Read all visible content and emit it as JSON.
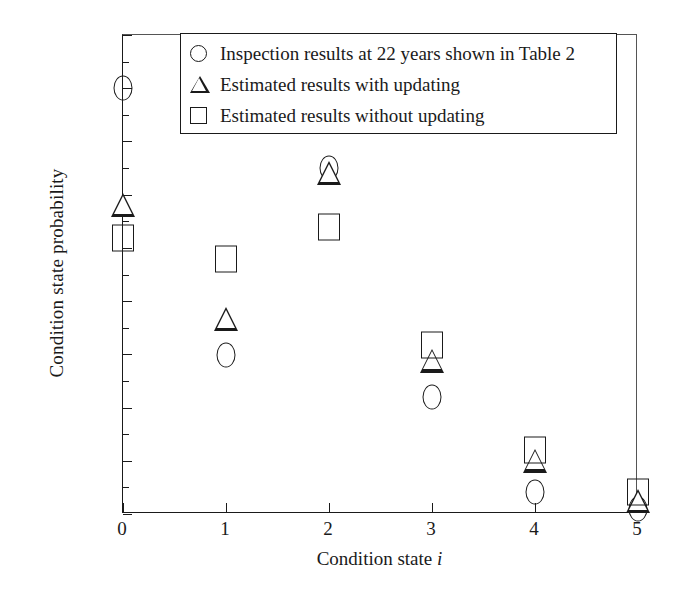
{
  "chart_data": {
    "type": "scatter",
    "title": "",
    "xlabel": "Condition state i",
    "ylabel": "Condition state probability",
    "categories": [
      "0",
      "1",
      "2",
      "3",
      "4",
      "5"
    ],
    "x": [
      0,
      1,
      2,
      3,
      4,
      5
    ],
    "xlim": [
      0,
      5
    ],
    "ylim": [
      0.0,
      0.45
    ],
    "ytick_labels": [
      "0.00",
      "0.05",
      "0.10",
      "0.15",
      "0.20",
      "0.25",
      "0.30",
      "0.35",
      "0.40",
      "0.45"
    ],
    "ytick_values": [
      0.0,
      0.05,
      0.1,
      0.15,
      0.2,
      0.25,
      0.3,
      0.35,
      0.4,
      0.45
    ],
    "xtick_labels": [
      "0",
      "1",
      "2",
      "3",
      "4",
      "5"
    ],
    "grid": false,
    "legend_position": "top-center",
    "series": [
      {
        "name": "Inspection results at 22 years shown in Table 2",
        "marker": "circle",
        "values": [
          0.4,
          0.149,
          0.325,
          0.11,
          0.021,
          0.005
        ]
      },
      {
        "name": "Estimated results with updating",
        "marker": "triangle",
        "values": [
          0.29,
          0.183,
          0.32,
          0.144,
          0.05,
          0.012
        ]
      },
      {
        "name": "Estimated results without updating",
        "marker": "square",
        "values": [
          0.259,
          0.24,
          0.27,
          0.159,
          0.06,
          0.021
        ]
      }
    ]
  },
  "legend": {
    "entries": [
      {
        "symbol": "circle-marker",
        "label": "Inspection results at 22 years shown in Table 2"
      },
      {
        "symbol": "triangle-marker",
        "label": "Estimated results with updating"
      },
      {
        "symbol": "square-marker",
        "label": "Estimated results without updating"
      }
    ]
  },
  "colors": {
    "foreground": "#1a1a1a",
    "background": "#ffffff"
  }
}
